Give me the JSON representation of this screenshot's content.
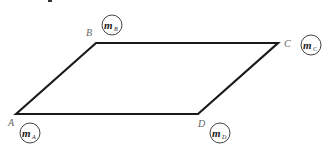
{
  "diagram": {
    "type": "parallelogram with point masses at vertices",
    "stroke_color": "#1a1a1a",
    "vertices": [
      {
        "id": "A",
        "label": "A",
        "x": 16,
        "y": 114,
        "mass": {
          "symbol": "m",
          "subscript": "A"
        }
      },
      {
        "id": "B",
        "label": "B",
        "x": 96,
        "y": 43,
        "mass": {
          "symbol": "m",
          "subscript": "B"
        }
      },
      {
        "id": "C",
        "label": "C",
        "x": 278,
        "y": 43,
        "mass": {
          "symbol": "m",
          "subscript": "C"
        }
      },
      {
        "id": "D",
        "label": "D",
        "x": 198,
        "y": 114,
        "mass": {
          "symbol": "m",
          "subscript": "D"
        }
      }
    ],
    "edges": [
      [
        "A",
        "B"
      ],
      [
        "B",
        "C"
      ],
      [
        "C",
        "D"
      ],
      [
        "D",
        "A"
      ]
    ]
  }
}
